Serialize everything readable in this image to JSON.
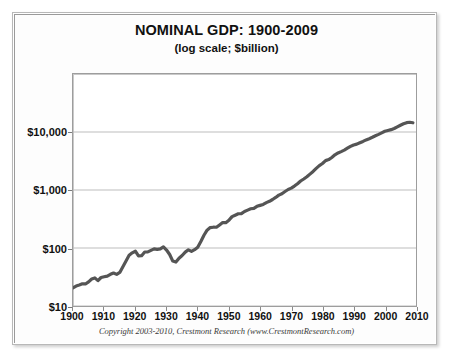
{
  "chart_data": {
    "type": "line",
    "title": "NOMINAL GDP: 1900-2009",
    "subtitle": "(log scale; $billion)",
    "xlabel": "",
    "ylabel": "",
    "log_y": true,
    "grid": true,
    "legend": "none",
    "xlim": [
      1900,
      2010
    ],
    "ylim": [
      10,
      100000
    ],
    "y_ticks": [
      10,
      100,
      1000,
      10000
    ],
    "y_tick_labels": [
      "$10",
      "$100",
      "$1,000",
      "$10,000"
    ],
    "x_ticks": [
      1900,
      1910,
      1920,
      1930,
      1940,
      1950,
      1960,
      1970,
      1980,
      1990,
      2000,
      2010
    ],
    "x_tick_labels": [
      "1900",
      "1910",
      "1920",
      "1930",
      "1940",
      "1950",
      "1960",
      "1970",
      "1980",
      "1990",
      "2000",
      "2010"
    ],
    "line_color": "#555555",
    "line_width": 3.2,
    "series": [
      {
        "name": "Nominal GDP",
        "x": [
          1900,
          1901,
          1902,
          1903,
          1904,
          1905,
          1906,
          1907,
          1908,
          1909,
          1910,
          1911,
          1912,
          1913,
          1914,
          1915,
          1916,
          1917,
          1918,
          1919,
          1920,
          1921,
          1922,
          1923,
          1924,
          1925,
          1926,
          1927,
          1928,
          1929,
          1930,
          1931,
          1932,
          1933,
          1934,
          1935,
          1936,
          1937,
          1938,
          1939,
          1940,
          1941,
          1942,
          1943,
          1944,
          1945,
          1946,
          1947,
          1948,
          1949,
          1950,
          1951,
          1952,
          1953,
          1954,
          1955,
          1956,
          1957,
          1958,
          1959,
          1960,
          1961,
          1962,
          1963,
          1964,
          1965,
          1966,
          1967,
          1968,
          1969,
          1970,
          1971,
          1972,
          1973,
          1974,
          1975,
          1976,
          1977,
          1978,
          1979,
          1980,
          1981,
          1982,
          1983,
          1984,
          1985,
          1986,
          1987,
          1988,
          1989,
          1990,
          1991,
          1992,
          1993,
          1994,
          1995,
          1996,
          1997,
          1998,
          1999,
          2000,
          2001,
          2002,
          2003,
          2004,
          2005,
          2006,
          2007,
          2008,
          2009
        ],
        "values": [
          20.6,
          22.1,
          23.0,
          24.1,
          24.0,
          26.1,
          29.2,
          30.5,
          27.4,
          31.0,
          32.0,
          32.8,
          35.2,
          37.0,
          35.1,
          37.9,
          47.5,
          59.6,
          74.9,
          82.6,
          88.0,
          73.1,
          73.6,
          85.3,
          85.7,
          91.0,
          96.7,
          94.8,
          96.5,
          104.6,
          92.2,
          77.4,
          59.5,
          57.2,
          66.8,
          74.3,
          84.9,
          93.0,
          87.4,
          93.5,
          102.9,
          129.4,
          166.0,
          203.1,
          224.6,
          228.2,
          227.8,
          249.9,
          274.8,
          272.8,
          300.2,
          347.3,
          367.7,
          389.7,
          391.1,
          426.2,
          450.1,
          474.9,
          482.0,
          522.5,
          543.3,
          563.3,
          605.1,
          638.6,
          685.8,
          743.7,
          815.0,
          861.7,
          942.5,
          1019.9,
          1075.9,
          1167.8,
          1282.4,
          1428.5,
          1548.8,
          1688.9,
          1877.6,
          2086.0,
          2356.6,
          2632.1,
          2862.5,
          3211.0,
          3345.0,
          3638.1,
          4040.7,
          4346.7,
          4590.2,
          4870.2,
          5252.6,
          5657.7,
          5979.6,
          6174.0,
          6539.3,
          6878.7,
          7308.8,
          7664.1,
          8100.2,
          8608.5,
          9089.2,
          9660.6,
          10284.8,
          10621.8,
          10977.5,
          11510.7,
          12274.9,
          13093.7,
          13855.9,
          14477.6,
          14718.6,
          14418.7
        ]
      }
    ]
  },
  "footer": {
    "copyright": "Copyright 2003-2010, Crestmont Research (www.CrestmontResearch.com)"
  }
}
